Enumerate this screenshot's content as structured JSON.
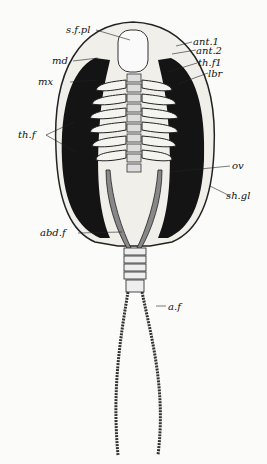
{
  "figure": {
    "labels": {
      "sfpl": "s.f.pl",
      "ant1": "ant.1",
      "ant2": "ant.2",
      "md": "md",
      "thf1": "th.f1",
      "lbr": "lbr",
      "mx": "mx",
      "thf": "th.f",
      "ov": "ov",
      "shgl": "sh.gl",
      "abdf": "abd.f",
      "af": "a.f"
    }
  }
}
